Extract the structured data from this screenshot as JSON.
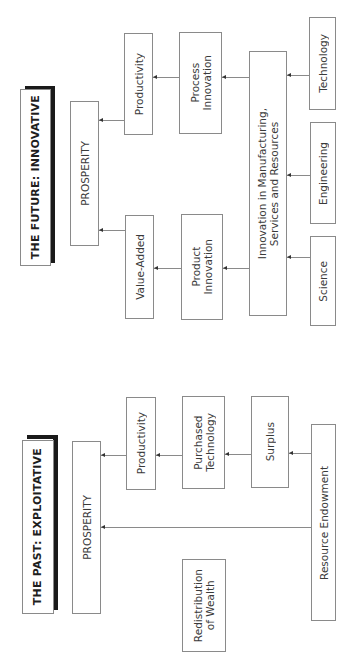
{
  "future": {
    "title": "THE FUTURE: INNOVATIVE",
    "prosperity": "PROSPERITY",
    "productivity": "Productivity",
    "value_added": "Value-Added",
    "process_innovation": "Process\nInnovation",
    "product_innovation": "Product\nInnovation",
    "innovation_msr": "Innovation in Manufacturing,\nServices and Resources",
    "technology": "Technology",
    "engineering": "Engineering",
    "science": "Science"
  },
  "past": {
    "title": "THE PAST: EXPLOITATIVE",
    "prosperity": "PROSPERITY",
    "productivity": "Productivity",
    "purchased_technology": "Purchased\nTechnology",
    "surplus": "Surplus",
    "resource_endowment": "Resource Endowment",
    "redistribution": "Redistribution\nof Wealth"
  },
  "colors": {
    "border": "#8a8a8a",
    "shadow": "#1a1a1a",
    "text": "#3a3a3a"
  }
}
